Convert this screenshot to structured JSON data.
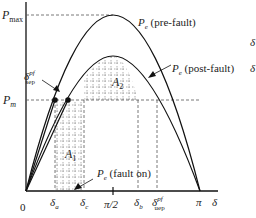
{
  "diagram": {
    "type": "power-angle curve (equal area criterion)",
    "axes": {
      "y_labels": {
        "pmax": "P",
        "pmax_sub": "max",
        "pm": "P",
        "pm_sub": "m"
      },
      "x_labels": {
        "origin": "0",
        "delta_a": "δ",
        "delta_a_sub": "a",
        "delta_c": "δ",
        "delta_c_sub": "c",
        "pi_half": "π/2",
        "delta_b": "δ",
        "delta_b_sub": "b",
        "delta_uep": "δ",
        "delta_uep_sub": "uep",
        "delta_uep_sup": "pf",
        "pi": "π",
        "delta_axis": "δ"
      }
    },
    "curves": {
      "pre_fault": {
        "label_main": "P",
        "label_sub": "e",
        "label_paren": " (pre-fault)"
      },
      "post_fault": {
        "label_main": "P",
        "label_sub": "e",
        "label_paren": " (post-fault)"
      },
      "fault_on": {
        "label_main": "P",
        "label_sub": "e",
        "label_paren": " (fault on)"
      }
    },
    "areas": {
      "a1": {
        "main": "A",
        "sub": "1"
      },
      "a2": {
        "main": "A",
        "sub": "2"
      }
    },
    "sep_label": {
      "main": "δ",
      "sub": "sep",
      "sup": "pf"
    },
    "right_edge": {
      "d1": "δ",
      "d2": "δ"
    },
    "colors": {
      "curve": "#111111",
      "dashed": "#555555",
      "text": "#222222"
    }
  }
}
